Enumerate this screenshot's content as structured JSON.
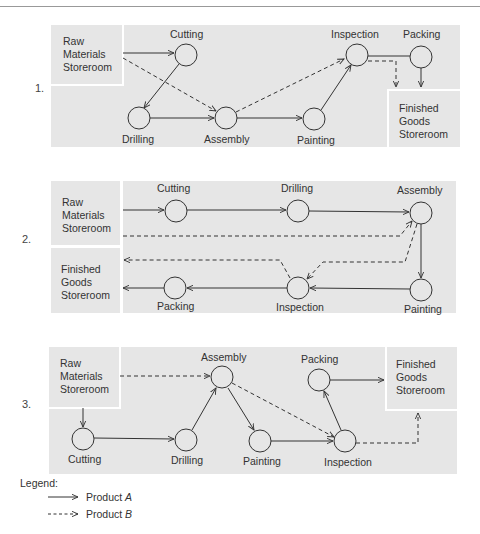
{
  "panels": [
    {
      "number": "1.",
      "raw_storeroom": [
        "Raw",
        "Materials",
        "Storeroom"
      ],
      "finished_storeroom": [
        "Finished",
        "Goods",
        "Storeroom"
      ],
      "stations": {
        "cutting": "Cutting",
        "drilling": "Drilling",
        "assembly": "Assembly",
        "painting": "Painting",
        "inspection": "Inspection",
        "packing": "Packing"
      }
    },
    {
      "number": "2.",
      "raw_storeroom": [
        "Raw",
        "Materials",
        "Storeroom"
      ],
      "finished_storeroom": [
        "Finished",
        "Goods",
        "Storeroom"
      ],
      "stations": {
        "cutting": "Cutting",
        "drilling": "Drilling",
        "assembly": "Assembly",
        "painting": "Painting",
        "inspection": "Inspection",
        "packing": "Packing"
      }
    },
    {
      "number": "3.",
      "raw_storeroom": [
        "Raw",
        "Materials",
        "Storeroom"
      ],
      "finished_storeroom": [
        "Finished",
        "Goods",
        "Storeroom"
      ],
      "stations": {
        "cutting": "Cutting",
        "drilling": "Drilling",
        "assembly": "Assembly",
        "painting": "Painting",
        "inspection": "Inspection",
        "packing": "Packing"
      }
    }
  ],
  "legend": {
    "title": "Legend:",
    "product_a": "Product",
    "product_a_letter": "A",
    "product_b": "Product",
    "product_b_letter": "B"
  },
  "colors": {
    "panel_bg": "#e6e6e6",
    "line": "#333333"
  }
}
